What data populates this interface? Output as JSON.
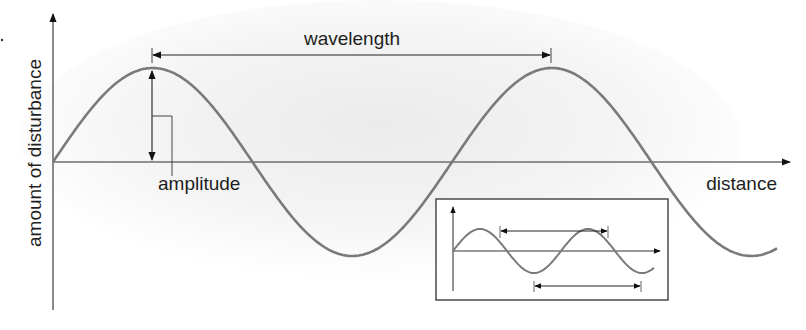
{
  "diagram": {
    "labels": {
      "y_axis": "amount of disturbance",
      "x_axis": "distance",
      "wavelength": "wavelength",
      "amplitude": "amplitude"
    },
    "colors": {
      "wave": "#7a7a7a",
      "axis": "#6e6e6e",
      "arrow": "#111111",
      "text": "#1e1e1e",
      "shading": "#ececec",
      "inset_border": "#555555"
    },
    "wave": {
      "baseline_y": 162,
      "amplitude_px": 94,
      "period_px": 399,
      "start_x": 53,
      "end_x": 778
    },
    "inset": {
      "description": "small wave diagram with wavelength measured peak-to-peak and trough-to-trough"
    }
  }
}
